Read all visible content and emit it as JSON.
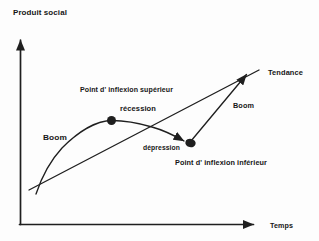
{
  "diagram": {
    "y_axis_title": "Produit social",
    "x_axis_label": "Temps",
    "trend_label": "Tendance",
    "upper_inflection_label": "Point d' inflexion supérieur",
    "recession_label": "récession",
    "depression_label": "dépression",
    "lower_inflection_label": "Point d' inflexion inférieur",
    "boom_left_label": "Boom",
    "boom_right_label": "Boom",
    "colors": {
      "ink": "#1f1f1f",
      "text": "#161616",
      "background": "#fdfdfd"
    }
  }
}
